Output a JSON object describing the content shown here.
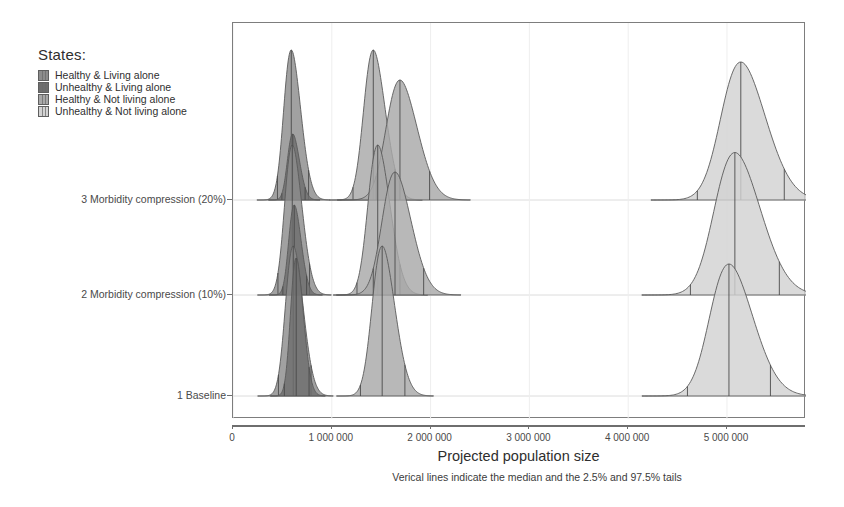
{
  "legend": {
    "title": "States:",
    "items": [
      {
        "label": "Healthy & Living alone",
        "color": "#8c8c8c"
      },
      {
        "label": "Unhealthy & Living alone",
        "color": "#6e6e6e"
      },
      {
        "label": "Healthy & Not living alone",
        "color": "#a8a8a8"
      },
      {
        "label": "Unhealthy & Not living alone",
        "color": "#d2d2d2"
      }
    ]
  },
  "axes": {
    "x_title": "Projected population size",
    "x_ticks": [
      {
        "value": 0,
        "label": "0"
      },
      {
        "value": 1000000,
        "label": "1 000 000"
      },
      {
        "value": 2000000,
        "label": "2 000 000"
      },
      {
        "value": 3000000,
        "label": "3 000 000"
      },
      {
        "value": 4000000,
        "label": "4 000 000"
      },
      {
        "value": 5000000,
        "label": "5 000 000"
      }
    ],
    "x_min": 0,
    "x_max": 5800000,
    "y_ticks": [
      {
        "label": "1 Baseline"
      },
      {
        "label": "2 Morbidity compression (10%)"
      },
      {
        "label": "3 Morbidity compression (20%)"
      }
    ]
  },
  "caption": "Verical lines indicate the median and the 2.5% and 97.5% tails",
  "chart_data": {
    "type": "area",
    "subtype": "ridgeline-density",
    "title": "",
    "xlabel": "Projected population size",
    "ylabel": "",
    "xlim": [
      0,
      5800000
    ],
    "grid": true,
    "legend_position": "top-left-outside",
    "annotation": "Verical lines indicate the median and the 2.5% and 97.5% tails",
    "categories": [
      "1 Baseline",
      "2 Morbidity compression (10%)",
      "3 Morbidity compression (20%)"
    ],
    "series": [
      {
        "name": "Healthy & Living alone",
        "color": "#8c8c8c",
        "distributions": [
          {
            "category": "1 Baseline",
            "median": 610000,
            "lower": 460000,
            "upper": 790000,
            "peak_height": 1.0,
            "sd": 88000
          },
          {
            "category": "2 Morbidity compression (10%)",
            "median": 600000,
            "lower": 455000,
            "upper": 775000,
            "peak_height": 1.0,
            "sd": 86000
          },
          {
            "category": "3 Morbidity compression (20%)",
            "median": 590000,
            "lower": 450000,
            "upper": 765000,
            "peak_height": 1.0,
            "sd": 85000
          }
        ]
      },
      {
        "name": "Unhealthy & Living alone",
        "color": "#6e6e6e",
        "distributions": [
          {
            "category": "1 Baseline",
            "median": 640000,
            "lower": 520000,
            "upper": 770000,
            "peak_height": 0.92,
            "sd": 64000
          },
          {
            "category": "2 Morbidity compression (10%)",
            "median": 620000,
            "lower": 505000,
            "upper": 745000,
            "peak_height": 0.6,
            "sd": 62000
          },
          {
            "category": "3 Morbidity compression (20%)",
            "median": 605000,
            "lower": 495000,
            "upper": 730000,
            "peak_height": 0.44,
            "sd": 60000
          }
        ]
      },
      {
        "name": "Healthy & Not living alone",
        "color": "#a8a8a8",
        "distributions": [
          {
            "category": "1 Baseline",
            "median": 1510000,
            "lower": 1290000,
            "upper": 1740000,
            "peak_height": 1.0,
            "sd": 113000
          },
          {
            "category": "2 Morbidity compression (10%)",
            "median": 1465000,
            "lower": 1255000,
            "upper": 1690000,
            "peak_height": 1.0,
            "sd": 110000
          },
          {
            "category": "3 Morbidity compression (20%)",
            "median": 1420000,
            "lower": 1215000,
            "upper": 1640000,
            "peak_height": 1.0,
            "sd": 108000
          }
        ]
      },
      {
        "name": "Unhealthy & Not living alone",
        "color": "#d2d2d2",
        "distributions": [
          {
            "category": "1 Baseline",
            "median": 5020000,
            "lower": 4600000,
            "upper": 5440000,
            "peak_height": 0.88,
            "sd": 215000
          },
          {
            "category": "2 Morbidity compression (10%)",
            "median": 5080000,
            "lower": 4630000,
            "upper": 5530000,
            "peak_height": 0.95,
            "sd": 230000
          },
          {
            "category": "3 Morbidity compression (20%)",
            "median": 5140000,
            "lower": 4700000,
            "upper": 5580000,
            "peak_height": 0.92,
            "sd": 222000
          }
        ]
      },
      {
        "name": "Healthy & Not living alone (secondary mode)",
        "color": "#a8a8a8",
        "secondary": true,
        "distributions": [
          {
            "category": "2 Morbidity compression (10%)",
            "median": 1640000,
            "lower": 1420000,
            "upper": 1930000,
            "peak_height": 0.82,
            "sd": 145000
          },
          {
            "category": "3 Morbidity compression (20%)",
            "median": 1690000,
            "lower": 1450000,
            "upper": 1990000,
            "peak_height": 0.8,
            "sd": 155000
          }
        ]
      }
    ]
  }
}
